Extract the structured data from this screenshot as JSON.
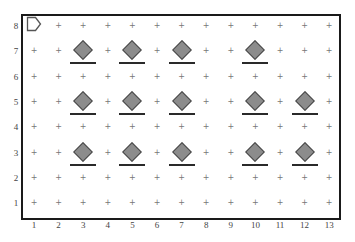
{
  "grid": {
    "columns": 13,
    "rows": 8,
    "x_labels": [
      "1",
      "2",
      "3",
      "4",
      "5",
      "6",
      "7",
      "8",
      "9",
      "10",
      "11",
      "12",
      "13"
    ],
    "y_labels": [
      "8",
      "7",
      "6",
      "5",
      "4",
      "3",
      "2",
      "1"
    ],
    "empty_cell_marker": "+"
  },
  "agent": {
    "icon": "pentagon-arrow-right-icon",
    "col": 1,
    "row": 8,
    "facing": "right"
  },
  "items": [
    {
      "type": "diamond",
      "col": 3,
      "row": 7
    },
    {
      "type": "diamond",
      "col": 5,
      "row": 7
    },
    {
      "type": "diamond",
      "col": 7,
      "row": 7
    },
    {
      "type": "diamond",
      "col": 10,
      "row": 7
    },
    {
      "type": "diamond",
      "col": 3,
      "row": 5
    },
    {
      "type": "diamond",
      "col": 5,
      "row": 5
    },
    {
      "type": "diamond",
      "col": 7,
      "row": 5
    },
    {
      "type": "diamond",
      "col": 10,
      "row": 5
    },
    {
      "type": "diamond",
      "col": 12,
      "row": 5
    },
    {
      "type": "diamond",
      "col": 3,
      "row": 3
    },
    {
      "type": "diamond",
      "col": 5,
      "row": 3
    },
    {
      "type": "diamond",
      "col": 7,
      "row": 3
    },
    {
      "type": "diamond",
      "col": 10,
      "row": 3
    },
    {
      "type": "diamond",
      "col": 12,
      "row": 3
    }
  ],
  "colors": {
    "diamond_fill": "#8c8c8c",
    "diamond_stroke": "#4a4a4a",
    "bar": "#2a2a2a",
    "border": "#1a1a1a",
    "marker": "#777777"
  }
}
